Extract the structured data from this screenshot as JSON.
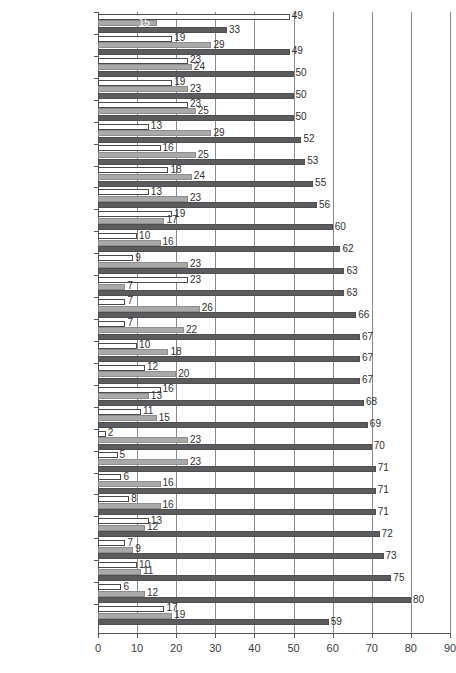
{
  "chart_data": {
    "type": "bar",
    "orientation": "horizontal",
    "title": "",
    "subtitle": "",
    "xlabel": "",
    "ylabel": "",
    "xlim": [
      0,
      90
    ],
    "xticks": [
      0,
      10,
      20,
      30,
      40,
      50,
      60,
      70,
      80,
      90
    ],
    "grid": true,
    "grid_axis": "x",
    "legend": null,
    "legend_position": "none",
    "series": [
      {
        "name": "series-1",
        "color": "#ffffff",
        "values": [
          49,
          19,
          23,
          19,
          23,
          13,
          16,
          18,
          13,
          19,
          10,
          9,
          23,
          7,
          7,
          10,
          12,
          16,
          11,
          2,
          5,
          6,
          8,
          13,
          7,
          10,
          6,
          17
        ]
      },
      {
        "name": "series-2",
        "color": "#a9a9a9",
        "values": [
          15,
          29,
          24,
          23,
          25,
          29,
          25,
          24,
          23,
          17,
          16,
          23,
          7,
          26,
          22,
          18,
          20,
          13,
          15,
          23,
          23,
          16,
          16,
          12,
          9,
          11,
          12,
          19
        ]
      },
      {
        "name": "series-3",
        "color": "#5c5c5e",
        "values": [
          33,
          49,
          50,
          50,
          50,
          52,
          53,
          55,
          56,
          60,
          62,
          63,
          63,
          66,
          67,
          67,
          67,
          68,
          69,
          70,
          71,
          71,
          71,
          72,
          73,
          75,
          80,
          59
        ]
      }
    ],
    "categories": [
      "United Kingdom",
      "Lithuania",
      "Latvia",
      "Bulgaria",
      "Cyprus",
      "Germany",
      "Estonia",
      "The Netherlands",
      "Austria",
      "France",
      "Spain",
      "Portugal",
      "Ireland",
      "Greece",
      "Malta",
      "Italy",
      "Belgium",
      "Luxembourg",
      "Sweden",
      "Hungary",
      "Finland",
      "Denmark",
      "Czech Republic",
      "Slovenia",
      "Romania",
      "Poland",
      "Slovakia",
      "EU 25"
    ]
  }
}
